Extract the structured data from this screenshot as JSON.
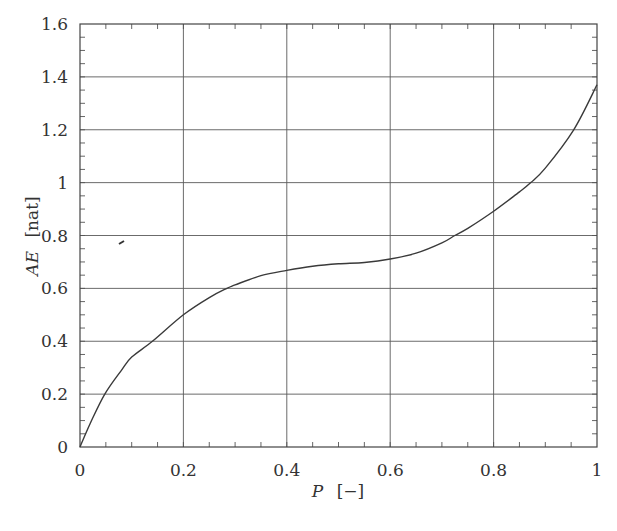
{
  "chart_data": {
    "type": "line",
    "title": "",
    "xlabel": "P [−]",
    "xlabel_var": "P",
    "xlabel_unit": "[−]",
    "ylabel": "AE [nat]",
    "ylabel_var": "AE",
    "ylabel_unit": "[nat]",
    "xlim": [
      0,
      1
    ],
    "ylim": [
      0,
      1.6
    ],
    "xticks": [
      0,
      0.2,
      0.4,
      0.6,
      0.8,
      1
    ],
    "xtick_labels": [
      "0",
      "0.2",
      "0.4",
      "0.6",
      "0.8",
      "1"
    ],
    "yticks": [
      0,
      0.2,
      0.4,
      0.6,
      0.8,
      1,
      1.2,
      1.4,
      1.6
    ],
    "ytick_labels": [
      "0",
      "0.2",
      "0.4",
      "0.6",
      "0.8",
      "1",
      "1.2",
      "1.4",
      "1.6"
    ],
    "minor_tick_step": 0.05,
    "grid": true,
    "legend": null,
    "series": [
      {
        "name": "AE",
        "color": "#3a3a3a",
        "x": [
          0,
          0.02,
          0.048,
          0.08,
          0.1,
          0.14,
          0.2,
          0.25,
          0.284,
          0.3,
          0.35,
          0.4,
          0.45,
          0.5,
          0.55,
          0.6,
          0.65,
          0.7,
          0.725,
          0.75,
          0.8,
          0.85,
          0.872,
          0.9,
          0.955,
          1.0
        ],
        "values": [
          0,
          0.09,
          0.2,
          0.29,
          0.34,
          0.4,
          0.5,
          0.565,
          0.6,
          0.613,
          0.648,
          0.668,
          0.684,
          0.693,
          0.698,
          0.711,
          0.733,
          0.772,
          0.8,
          0.827,
          0.892,
          0.965,
          1.0,
          1.055,
          1.2,
          1.37
        ]
      }
    ],
    "annotations": []
  }
}
